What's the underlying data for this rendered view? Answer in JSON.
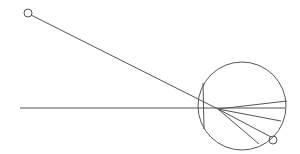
{
  "diagram": {
    "stroke_color": "#555555",
    "background_color": "#ffffff",
    "elements": [
      "start-marker",
      "incident-ray",
      "axis-line",
      "large-circle",
      "chord",
      "fan-rays",
      "end-marker"
    ],
    "fan_ray_count": 5
  }
}
